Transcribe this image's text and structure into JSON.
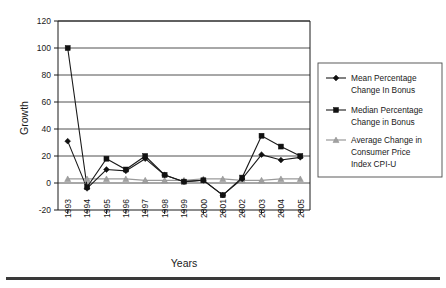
{
  "chart_data": {
    "type": "line",
    "title": "",
    "xlabel": "Years",
    "ylabel": "Growth",
    "grid": true,
    "legend_position": "right",
    "xlim": [
      1993,
      2005
    ],
    "ylim": [
      -20,
      120
    ],
    "ytick_values": [
      -20,
      0,
      20,
      40,
      60,
      80,
      100,
      120
    ],
    "ytick_labels": [
      "-20",
      "0",
      "20",
      "40",
      "60",
      "80",
      "100",
      "120"
    ],
    "categories": [
      "1993",
      "1994",
      "1995",
      "1996",
      "1997",
      "1998",
      "1999",
      "2000",
      "2001",
      "2002",
      "2003",
      "2004",
      "2005"
    ],
    "series": [
      {
        "name": "Mean Percentage Change In Bonus",
        "marker": "diamond",
        "color": "#111111",
        "values": [
          31,
          -4,
          10,
          9,
          18,
          6,
          1,
          2,
          -9,
          3,
          21,
          17,
          19
        ]
      },
      {
        "name": "Median Percentage Change in Bonus",
        "marker": "square",
        "color": "#111111",
        "values": [
          100,
          -3,
          18,
          10,
          20,
          6,
          1,
          2,
          -9,
          4,
          35,
          27,
          20
        ]
      },
      {
        "name": "Average Change in Consumer Price Index CPI-U",
        "marker": "triangle",
        "color": "#a0a0a0",
        "values": [
          3,
          3,
          3,
          3,
          2,
          2,
          2,
          3,
          3,
          2,
          2,
          3,
          3
        ]
      }
    ]
  },
  "legend": {
    "entries": [
      {
        "label_line1": "Mean Percentage",
        "label_line2": "Change In Bonus",
        "label_line3": ""
      },
      {
        "label_line1": "Median Percentage",
        "label_line2": "Change in Bonus",
        "label_line3": ""
      },
      {
        "label_line1": "Average Change in",
        "label_line2": "Consumer Price",
        "label_line3": "Index CPI-U"
      }
    ]
  },
  "axes": {
    "y_title": "Growth",
    "x_title": "Years"
  },
  "colors": {
    "series_dark": "#111111",
    "series_gray": "#a0a0a0",
    "grid": "#3c3c3c",
    "axis": "#1a1a1a",
    "background": "#ffffff"
  }
}
